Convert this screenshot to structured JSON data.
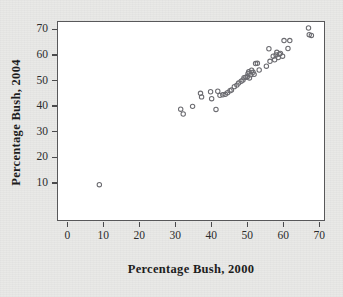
{
  "figure": {
    "background_color": "#e9e9e7",
    "plot_background_color": "#ffffff",
    "frame_color": "#58585a",
    "marker_color": "#6b6b70"
  },
  "chart_data": {
    "type": "scatter",
    "title": "",
    "xlabel": "Percentage Bush, 2000",
    "ylabel": "Percentage Bush, 2004",
    "xlim": [
      -2,
      73
    ],
    "ylim": [
      2,
      74
    ],
    "xticks": [
      0,
      10,
      20,
      30,
      40,
      50,
      60,
      70
    ],
    "yticks": [
      10,
      20,
      30,
      40,
      50,
      60,
      70
    ],
    "xticklabels": [
      "0",
      "10",
      "20",
      "30",
      "40",
      "50",
      "60",
      "70"
    ],
    "yticklabels": [
      "10",
      "20",
      "30",
      "40",
      "50",
      "60",
      "70"
    ],
    "grid": false,
    "legend": false,
    "marker": "open-circle",
    "marker_size": 4,
    "n_points": 51,
    "points": [
      [
        8.9,
        9.3
      ],
      [
        31.5,
        38.8
      ],
      [
        32.2,
        36.9
      ],
      [
        34.8,
        39.9
      ],
      [
        37.0,
        45.0
      ],
      [
        37.3,
        43.6
      ],
      [
        39.8,
        45.6
      ],
      [
        40.1,
        42.9
      ],
      [
        41.3,
        38.7
      ],
      [
        41.8,
        45.8
      ],
      [
        42.4,
        44.2
      ],
      [
        43.2,
        44.4
      ],
      [
        43.9,
        44.6
      ],
      [
        44.5,
        45.2
      ],
      [
        45.2,
        46.0
      ],
      [
        45.6,
        46.3
      ],
      [
        46.4,
        47.6
      ],
      [
        47.1,
        48.2
      ],
      [
        47.6,
        49.0
      ],
      [
        48.3,
        49.7
      ],
      [
        48.8,
        50.2
      ],
      [
        49.1,
        51.1
      ],
      [
        49.6,
        51.3
      ],
      [
        50.0,
        51.5
      ],
      [
        50.2,
        52.6
      ],
      [
        50.4,
        53.4
      ],
      [
        50.6,
        51.0
      ],
      [
        51.0,
        52.2
      ],
      [
        51.2,
        54.0
      ],
      [
        51.6,
        53.2
      ],
      [
        51.9,
        52.4
      ],
      [
        52.3,
        56.6
      ],
      [
        52.8,
        56.7
      ],
      [
        53.3,
        54.1
      ],
      [
        55.3,
        55.6
      ],
      [
        56.0,
        62.4
      ],
      [
        56.3,
        57.5
      ],
      [
        57.2,
        59.5
      ],
      [
        57.6,
        58.1
      ],
      [
        58.0,
        60.0
      ],
      [
        58.2,
        61.0
      ],
      [
        58.6,
        59.0
      ],
      [
        58.9,
        60.3
      ],
      [
        59.2,
        60.6
      ],
      [
        59.8,
        59.5
      ],
      [
        60.2,
        65.6
      ],
      [
        61.3,
        62.5
      ],
      [
        61.8,
        65.6
      ],
      [
        67.0,
        70.5
      ],
      [
        67.2,
        67.9
      ],
      [
        67.8,
        67.6
      ]
    ],
    "axis_mapping": {
      "x_origin_px": 67.3,
      "x_scale_px_per_unit": 3.6,
      "y_top_value": 70,
      "y_top_px": 29.3,
      "y_scale_px_per_unit": 2.56
    }
  }
}
